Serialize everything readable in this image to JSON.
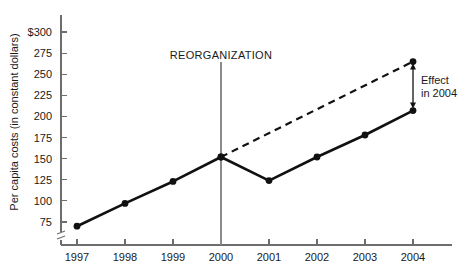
{
  "chart_data": {
    "type": "line",
    "title": "",
    "subtitle": "",
    "xlabel": "",
    "ylabel": "Per capita costs (in constant dollars)",
    "categories": [
      "1997",
      "1998",
      "1999",
      "2000",
      "2001",
      "2002",
      "2003",
      "2004"
    ],
    "x": [
      1997,
      1998,
      1999,
      2000,
      2001,
      2002,
      2003,
      2004
    ],
    "ylim": [
      62,
      300
    ],
    "y_axis_break": true,
    "y_ticks": [
      75,
      100,
      125,
      150,
      175,
      200,
      225,
      250,
      275,
      300
    ],
    "y_tick_labels": [
      "75",
      "100",
      "125",
      "150",
      "175",
      "200",
      "225",
      "250",
      "275",
      "$300"
    ],
    "grid": false,
    "legend": "none",
    "series": [
      {
        "name": "Actual per capita costs",
        "style": "solid",
        "x": [
          1997,
          1998,
          1999,
          2000,
          2001,
          2002,
          2003,
          2004
        ],
        "values": [
          70,
          97,
          123,
          152,
          124,
          152,
          178,
          207
        ],
        "markers": true
      },
      {
        "name": "Projected trend without reorganization",
        "style": "dashed",
        "x": [
          2000,
          2004
        ],
        "values": [
          152,
          265
        ],
        "markers": true
      }
    ],
    "annotations": [
      {
        "id": "reorganization",
        "label": "REORGANIZATION",
        "type": "vertical-line",
        "x": 2000
      },
      {
        "id": "effect-2004",
        "label_line1": "Effect",
        "label_line2": "in 2004",
        "type": "double-arrow",
        "x": 2004,
        "y_from": 207,
        "y_to": 265
      }
    ],
    "colors": {
      "series_line": "#111111",
      "axis": "#6d6d6d",
      "event_line": "#8a8a8a",
      "text": "#1a1a1a",
      "background": "#ffffff"
    }
  },
  "axes": {
    "y_label": "Per capita costs (in constant dollars)",
    "y_ticks": [
      {
        "label": "$300",
        "value": 300
      },
      {
        "label": "275",
        "value": 275
      },
      {
        "label": "250",
        "value": 250
      },
      {
        "label": "225",
        "value": 225
      },
      {
        "label": "200",
        "value": 200
      },
      {
        "label": "175",
        "value": 175
      },
      {
        "label": "150",
        "value": 150
      },
      {
        "label": "125",
        "value": 125
      },
      {
        "label": "100",
        "value": 100
      },
      {
        "label": "75",
        "value": 75
      }
    ],
    "x_ticks": [
      {
        "label": "1997",
        "value": 1997
      },
      {
        "label": "1998",
        "value": 1998
      },
      {
        "label": "1999",
        "value": 1999
      },
      {
        "label": "2000",
        "value": 2000
      },
      {
        "label": "2001",
        "value": 2001
      },
      {
        "label": "2002",
        "value": 2002
      },
      {
        "label": "2003",
        "value": 2003
      },
      {
        "label": "2004",
        "value": 2004
      }
    ]
  },
  "annotations": {
    "reorganization": "REORGANIZATION",
    "effect_line1": "Effect",
    "effect_line2": "in 2004"
  }
}
